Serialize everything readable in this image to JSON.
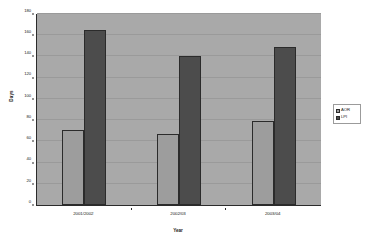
{
  "chart_data": {
    "type": "bar",
    "title": "",
    "xlabel": "Year",
    "ylabel": "Days",
    "categories": [
      "2001/2002",
      "2002/03",
      "2003/04"
    ],
    "series": [
      {
        "name": "AOR",
        "values": [
          71,
          67,
          79
        ],
        "color": "#9d9d9d"
      },
      {
        "name": "LPI",
        "values": [
          165,
          140,
          149
        ],
        "color": "#4c4c4c"
      }
    ],
    "ylim": [
      0,
      180
    ],
    "yticks": [
      0,
      20,
      40,
      60,
      80,
      100,
      120,
      140,
      160,
      180
    ],
    "ytick_labels": [
      "0",
      "20",
      "40",
      "60",
      "80",
      "100",
      "120",
      "140",
      "160",
      "180"
    ],
    "grid": true,
    "legend_position": "right",
    "plot_background": "#a9a9a9",
    "figure_background": "#ffffff"
  }
}
